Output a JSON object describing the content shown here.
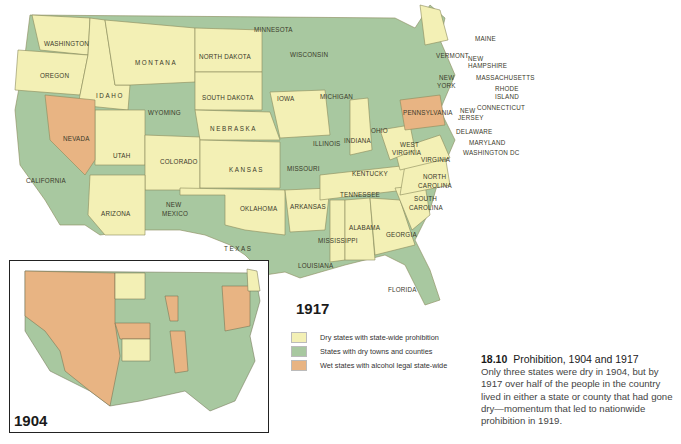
{
  "colors": {
    "dry": "#f3f0b5",
    "dry_towns": "#a8c8a0",
    "wet": "#e8b483",
    "border": "#8a8a5a",
    "water": "#ffffff"
  },
  "map_1917": {
    "year": "1917",
    "labels": {
      "washington": "WASHINGTON",
      "oregon": "OREGON",
      "idaho": "IDAHO",
      "montana": "MONTANA",
      "wyoming": "WYOMING",
      "nevada": "NEVADA",
      "california": "CALIFORNIA",
      "utah": "UTAH",
      "colorado": "COLORADO",
      "arizona": "ARIZONA",
      "new_mexico_1": "NEW",
      "new_mexico_2": "MEXICO",
      "north_dakota": "NORTH DAKOTA",
      "south_dakota": "SOUTH DAKOTA",
      "nebraska": "NEBRASKA",
      "kansas": "KANSAS",
      "oklahoma": "OKLAHOMA",
      "texas": "TEXAS",
      "minnesota": "MINNESOTA",
      "iowa": "IOWA",
      "missouri": "MISSOURI",
      "arkansas": "ARKANSAS",
      "louisiana": "LOUISIANA",
      "wisconsin": "WISCONSIN",
      "illinois": "ILLINOIS",
      "michigan": "MICHIGAN",
      "indiana": "INDIANA",
      "ohio": "OHIO",
      "kentucky": "KENTUCKY",
      "tennessee": "TENNESSEE",
      "mississippi": "MISSISSIPPI",
      "alabama": "ALABAMA",
      "georgia": "GEORGIA",
      "florida": "FLORIDA",
      "south_carolina_1": "SOUTH",
      "south_carolina_2": "CAROLINA",
      "north_carolina_1": "NORTH",
      "north_carolina_2": "CAROLINA",
      "virginia": "VIRGINIA",
      "west_virginia_1": "WEST",
      "west_virginia_2": "VIRGINIA",
      "pennsylvania": "PENNSYLVANIA",
      "new_york_1": "NEW",
      "new_york_2": "YORK",
      "vermont": "VERMONT",
      "new_hampshire_1": "NEW",
      "new_hampshire_2": "HAMPSHIRE",
      "maine": "MAINE",
      "massachusetts": "MASSACHUSETTS",
      "rhode_island_1": "RHODE",
      "rhode_island_2": "ISLAND",
      "connecticut": "CONNECTICUT",
      "new_jersey_1": "NEW",
      "new_jersey_2": "JERSEY",
      "delaware": "DELAWARE",
      "maryland": "MARYLAND",
      "washington_dc": "WASHINGTON DC"
    }
  },
  "map_1904": {
    "year": "1904"
  },
  "legend": {
    "items": [
      {
        "label": "Dry states with state-wide prohibition",
        "color": "#f3f0b5"
      },
      {
        "label": "States with dry towns and counties",
        "color": "#a8c8a0"
      },
      {
        "label": "Wet states with alcohol legal state-wide",
        "color": "#e8b483"
      }
    ]
  },
  "caption": {
    "number": "18.10",
    "title": "Prohibition, 1904 and 1917",
    "body": "Only three states were dry in 1904, but by 1917 over half of the people in the country lived in either a state or county that had gone dry—momentum that led to nationwide prohibition in 1919."
  }
}
